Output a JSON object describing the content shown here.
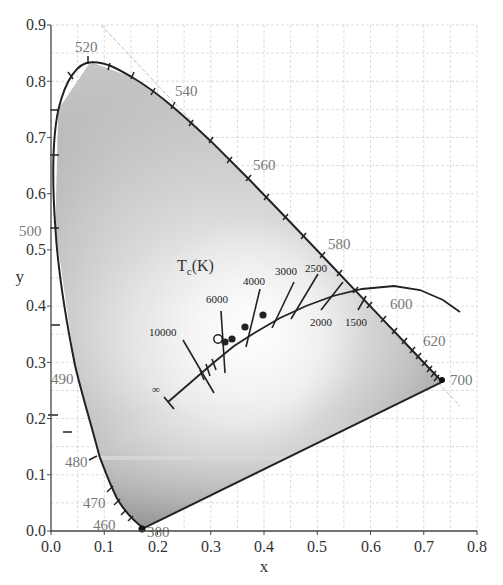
{
  "chart_data": {
    "type": "scatter",
    "xlabel": "x",
    "ylabel": "y",
    "xlim": [
      0.0,
      0.8
    ],
    "ylim": [
      0.0,
      0.9
    ],
    "grid": true,
    "grid_step": 0.05,
    "x_ticks": [
      "0.0",
      "0.1",
      "0.2",
      "0.3",
      "0.4",
      "0.5",
      "0.6",
      "0.7",
      "0.8"
    ],
    "y_ticks": [
      "0.0",
      "0.1",
      "0.2",
      "0.3",
      "0.4",
      "0.5",
      "0.6",
      "0.7",
      "0.8",
      "0.9"
    ],
    "spectral_locus": {
      "name": "Spectral locus (nm)",
      "labeled_points": [
        {
          "nm": "380",
          "x": 0.174,
          "y": 0.005
        },
        {
          "nm": "460",
          "x": 0.144,
          "y": 0.03
        },
        {
          "nm": "470",
          "x": 0.124,
          "y": 0.058
        },
        {
          "nm": "480",
          "x": 0.091,
          "y": 0.133
        },
        {
          "nm": "490",
          "x": 0.045,
          "y": 0.295
        },
        {
          "nm": "500",
          "x": 0.008,
          "y": 0.538
        },
        {
          "nm": "520",
          "x": 0.074,
          "y": 0.834
        },
        {
          "nm": "540",
          "x": 0.23,
          "y": 0.754
        },
        {
          "nm": "560",
          "x": 0.373,
          "y": 0.625
        },
        {
          "nm": "580",
          "x": 0.513,
          "y": 0.487
        },
        {
          "nm": "600",
          "x": 0.627,
          "y": 0.373
        },
        {
          "nm": "620",
          "x": 0.692,
          "y": 0.308
        },
        {
          "nm": "700",
          "x": 0.735,
          "y": 0.265
        }
      ]
    },
    "planckian_locus": {
      "label": "Tc(K)",
      "isotherms": [
        {
          "T": "∞",
          "x": 0.24,
          "y": 0.234
        },
        {
          "T": "10000",
          "x": 0.281,
          "y": 0.288
        },
        {
          "T": "6000",
          "x": 0.322,
          "y": 0.332
        },
        {
          "T": "4000",
          "x": 0.38,
          "y": 0.377
        },
        {
          "T": "3000",
          "x": 0.437,
          "y": 0.404
        },
        {
          "T": "2500",
          "x": 0.477,
          "y": 0.414
        },
        {
          "T": "2000",
          "x": 0.527,
          "y": 0.413
        },
        {
          "T": "1500",
          "x": 0.586,
          "y": 0.393
        }
      ]
    },
    "markers": [
      {
        "type": "open-circle",
        "x": 0.313,
        "y": 0.329
      },
      {
        "type": "filled-circle",
        "x": 0.324,
        "y": 0.33
      },
      {
        "type": "filled-circle",
        "x": 0.336,
        "y": 0.34
      },
      {
        "type": "filled-circle",
        "x": 0.362,
        "y": 0.363
      },
      {
        "type": "filled-circle",
        "x": 0.394,
        "y": 0.385
      }
    ],
    "annotations": [
      "Tc(K)",
      "∞",
      "10000",
      "6000",
      "4000",
      "3000",
      "2500",
      "2000",
      "1500"
    ]
  },
  "labels": {
    "xlabel": "x",
    "ylabel": "y",
    "tc_main": "T",
    "tc_sub": "c",
    "tc_unit": "(K)",
    "inf": "∞",
    "ct_10000": "10000",
    "ct_6000": "6000",
    "ct_4000": "4000",
    "ct_3000": "3000",
    "ct_2500": "2500",
    "ct_2000": "2000",
    "ct_1500": "1500",
    "xt0": "0.0",
    "xt1": "0.1",
    "xt2": "0.2",
    "xt3": "0.3",
    "xt4": "0.4",
    "xt5": "0.5",
    "xt6": "0.6",
    "xt7": "0.7",
    "xt8": "0.8",
    "yt0": "0.0",
    "yt1": "0.1",
    "yt2": "0.2",
    "yt3": "0.3",
    "yt4": "0.4",
    "yt5": "0.5",
    "yt6": "0.6",
    "yt7": "0.7",
    "yt8": "0.8",
    "yt9": "0.9",
    "wl380": "380",
    "wl460": "460",
    "wl470": "470",
    "wl480": "480",
    "wl490": "490",
    "wl500": "500",
    "wl520": "520",
    "wl540": "540",
    "wl560": "560",
    "wl580": "580",
    "wl600": "600",
    "wl620": "620",
    "wl700": "700"
  }
}
